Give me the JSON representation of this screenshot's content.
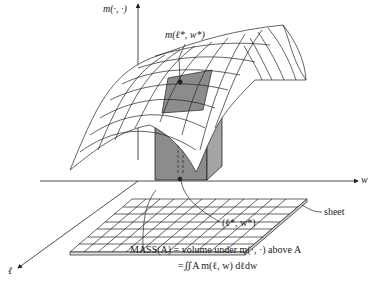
{
  "diagram": {
    "axes": {
      "vertical_label": "m(·, ·)",
      "right_label": "w",
      "left_label": "ℓ"
    },
    "annotations": {
      "peak_point": "m(ℓ*, w*)",
      "base_point": "(ℓ*, w*)",
      "sheet": "sheet",
      "mass_line1": "MASS(A) = volume under m(·, ·) above A",
      "mass_line2": "=∬A m(ℓ, w) dℓdw"
    },
    "colors": {
      "line": "#222222",
      "shade": "#8c8c8c",
      "background": "#ffffff"
    }
  }
}
